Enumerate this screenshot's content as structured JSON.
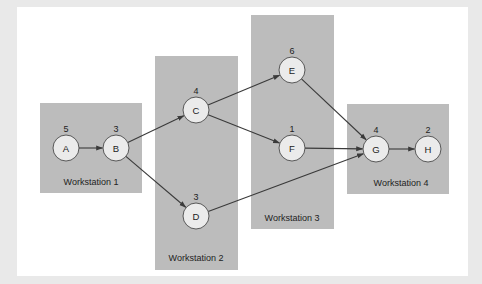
{
  "diagram": {
    "type": "precedence-network",
    "colors": {
      "box": "#bcbcbc",
      "node_fill": "#ebebeb",
      "node_stroke": "#4a4a4a",
      "edge": "#3a3a3a",
      "panel": "#ffffff",
      "background": "#e9e9e9"
    },
    "workstations": [
      {
        "id": "ws1",
        "label": "Workstation 1",
        "x": 40,
        "y": 103,
        "w": 102,
        "h": 90,
        "lx": 91,
        "ly": 185
      },
      {
        "id": "ws2",
        "label": "Workstation 2",
        "x": 155,
        "y": 56,
        "w": 83,
        "h": 214,
        "lx": 196,
        "ly": 261
      },
      {
        "id": "ws3",
        "label": "Workstation 3",
        "x": 251,
        "y": 15,
        "w": 83,
        "h": 214,
        "lx": 292,
        "ly": 221
      },
      {
        "id": "ws4",
        "label": "Workstation 4",
        "x": 347,
        "y": 104,
        "w": 102,
        "h": 90,
        "lx": 401,
        "ly": 186
      }
    ],
    "nodes": [
      {
        "id": "A",
        "label": "A",
        "time": "5",
        "cx": 66,
        "cy": 148
      },
      {
        "id": "B",
        "label": "B",
        "time": "3",
        "cx": 116,
        "cy": 148
      },
      {
        "id": "C",
        "label": "C",
        "time": "4",
        "cx": 196,
        "cy": 110
      },
      {
        "id": "D",
        "label": "D",
        "time": "3",
        "cx": 196,
        "cy": 216
      },
      {
        "id": "E",
        "label": "E",
        "time": "6",
        "cx": 292,
        "cy": 70
      },
      {
        "id": "F",
        "label": "F",
        "time": "1",
        "cx": 292,
        "cy": 148
      },
      {
        "id": "G",
        "label": "G",
        "time": "4",
        "cx": 376,
        "cy": 149
      },
      {
        "id": "H",
        "label": "H",
        "time": "2",
        "cx": 428,
        "cy": 149
      }
    ],
    "edges": [
      {
        "from": "A",
        "to": "B"
      },
      {
        "from": "B",
        "to": "C"
      },
      {
        "from": "B",
        "to": "D"
      },
      {
        "from": "C",
        "to": "E"
      },
      {
        "from": "C",
        "to": "F"
      },
      {
        "from": "E",
        "to": "G"
      },
      {
        "from": "F",
        "to": "G"
      },
      {
        "from": "D",
        "to": "G"
      },
      {
        "from": "G",
        "to": "H"
      }
    ],
    "node_radius": 13
  }
}
